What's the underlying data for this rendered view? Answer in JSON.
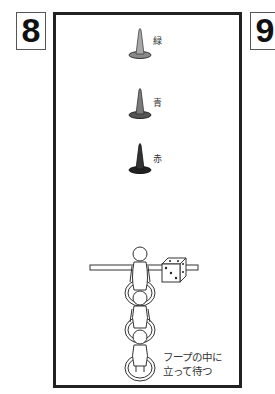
{
  "panels": {
    "left_number": "8",
    "right_number": "9"
  },
  "cones": [
    {
      "label": "緑",
      "color": "#a8a8a8",
      "x": 140,
      "y": 45
    },
    {
      "label": "青",
      "color": "#7a7a7a",
      "x": 140,
      "y": 105
    },
    {
      "label": "赤",
      "color": "#333333",
      "x": 140,
      "y": 160
    }
  ],
  "caption": "フープの中に\n立って待つ",
  "elements": {
    "bar": "horizontal-bar",
    "dice": "dice",
    "hoops": 3,
    "figures": 3
  }
}
